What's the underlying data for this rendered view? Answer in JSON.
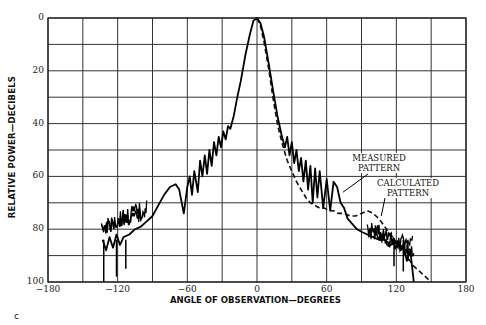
{
  "chart_data": {
    "type": "line",
    "title": "",
    "xlabel": "ANGLE OF OBSERVATION—DEGREES",
    "ylabel": "RELATIVE POWER—DECIBELS",
    "xlim": [
      -180,
      180
    ],
    "ylim": [
      0,
      100
    ],
    "y_inverted": true,
    "grid": true,
    "x_gridlines_every": 30,
    "y_gridlines_every": 10,
    "xticks": [
      -180,
      -120,
      -60,
      0,
      60,
      120,
      180
    ],
    "xtick_labels": [
      "−180",
      "−120",
      "−60",
      "0",
      "60",
      "120",
      "180"
    ],
    "yticks": [
      0,
      20,
      40,
      60,
      80,
      100
    ],
    "ytick_labels": [
      "0",
      "20",
      "40",
      "60",
      "80",
      "100"
    ],
    "legend": "none (inline annotations)",
    "annotations": [
      {
        "text": "MEASURED\nPATTERN",
        "x": 101,
        "y": 57,
        "points_to": {
          "x": 74,
          "y": 66
        }
      },
      {
        "text": "CALCULATED\nPATTERN",
        "x": 128,
        "y": 64,
        "points_to": {
          "x": 107,
          "y": 75
        }
      }
    ],
    "series": [
      {
        "name": "Measured pattern",
        "style": "solid",
        "x": [
          -133,
          -130,
          -127,
          -124,
          -121,
          -118,
          -115,
          -110,
          -105,
          -100,
          -95,
          -90,
          -85,
          -80,
          -75,
          -70,
          -67,
          -63,
          -60,
          -58,
          -56,
          -54,
          -51,
          -49,
          -47,
          -45,
          -43,
          -41,
          -39,
          -37,
          -35,
          -33,
          -31,
          -29,
          -27,
          -25,
          -23,
          -20,
          -17,
          -14,
          -10,
          -6,
          -3,
          0,
          3,
          6,
          10,
          14,
          18,
          21,
          24,
          26,
          28,
          30,
          32,
          34,
          36,
          38,
          40,
          42,
          44,
          46,
          48,
          50,
          52,
          54,
          57,
          60,
          63,
          66,
          69,
          72,
          75,
          78,
          82,
          86,
          90,
          95,
          100,
          105,
          110,
          115,
          120,
          123,
          126,
          129,
          132,
          135
        ],
        "y": [
          84,
          88,
          83,
          87,
          82,
          86,
          83,
          82,
          80,
          79,
          77,
          75,
          71,
          67,
          64,
          63,
          65,
          74,
          64,
          60,
          67,
          58,
          66,
          54,
          60,
          52,
          59,
          50,
          56,
          47,
          52,
          45,
          49,
          43,
          46,
          41,
          42,
          37,
          30,
          24,
          14,
          6,
          1,
          0,
          2,
          7,
          17,
          28,
          38,
          44,
          49,
          45,
          52,
          47,
          55,
          50,
          58,
          53,
          62,
          54,
          65,
          56,
          70,
          57,
          68,
          58,
          72,
          61,
          73,
          62,
          64,
          70,
          72,
          76,
          78,
          80,
          81,
          82,
          83,
          84,
          84,
          86,
          85,
          87,
          86,
          92,
          88,
          100
        ]
      },
      {
        "name": "Calculated pattern",
        "style": "dashed",
        "x": [
          0,
          3,
          6,
          10,
          14,
          18,
          22,
          26,
          30,
          34,
          38,
          42,
          46,
          50,
          54,
          58,
          62,
          66,
          70,
          75,
          80,
          85,
          90,
          95,
          100,
          105,
          110,
          115,
          120,
          125,
          130,
          135,
          140,
          145,
          150
        ],
        "y": [
          0,
          3,
          9,
          19,
          31,
          41,
          48,
          54,
          58,
          62,
          65,
          68,
          70,
          71,
          72,
          72,
          73,
          73,
          74,
          74,
          75,
          75,
          74,
          73,
          74,
          76,
          79,
          82,
          85,
          88,
          91,
          94,
          96,
          98,
          100
        ]
      }
    ]
  },
  "figure": {
    "panel_label": "c"
  }
}
